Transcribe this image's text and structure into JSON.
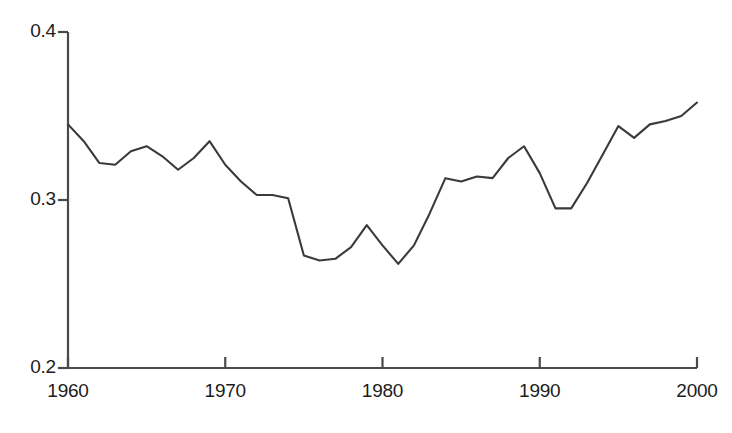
{
  "chart_data": {
    "type": "line",
    "title": "",
    "subtitle": "",
    "xlabel": "",
    "ylabel": "",
    "xlim": [
      1960,
      2000
    ],
    "ylim": [
      0.2,
      0.4
    ],
    "grid": false,
    "legend": null,
    "x_ticks": [
      1960,
      1970,
      1980,
      1990,
      2000
    ],
    "x_tick_labels": [
      "1960",
      "1970",
      "1980",
      "1990",
      "2000"
    ],
    "y_ticks": [
      0.2,
      0.3,
      0.4
    ],
    "y_tick_labels": [
      "0.2",
      "0.3",
      "0.4"
    ],
    "line_color": "#3a3a3a",
    "axis_color": "#4a4a4a",
    "background_color": "#ffffff",
    "series": [
      {
        "name": "series-1",
        "x": [
          1960,
          1961,
          1962,
          1963,
          1964,
          1965,
          1966,
          1967,
          1968,
          1969,
          1970,
          1971,
          1972,
          1973,
          1974,
          1975,
          1976,
          1977,
          1978,
          1979,
          1980,
          1981,
          1982,
          1983,
          1984,
          1985,
          1986,
          1987,
          1988,
          1989,
          1990,
          1991,
          1992,
          1993,
          1994,
          1995,
          1996,
          1997,
          1998,
          1999,
          2000
        ],
        "values": [
          0.345,
          0.335,
          0.322,
          0.321,
          0.329,
          0.332,
          0.326,
          0.318,
          0.325,
          0.335,
          0.321,
          0.311,
          0.303,
          0.303,
          0.301,
          0.267,
          0.264,
          0.265,
          0.272,
          0.285,
          0.273,
          0.262,
          0.273,
          0.292,
          0.313,
          0.311,
          0.314,
          0.313,
          0.325,
          0.332,
          0.316,
          0.295,
          0.295,
          0.31,
          0.327,
          0.344,
          0.337,
          0.345,
          0.347,
          0.35,
          0.358
        ]
      }
    ]
  },
  "axes": {
    "y_axis_name": "y-axis",
    "x_axis_name": "x-axis"
  }
}
